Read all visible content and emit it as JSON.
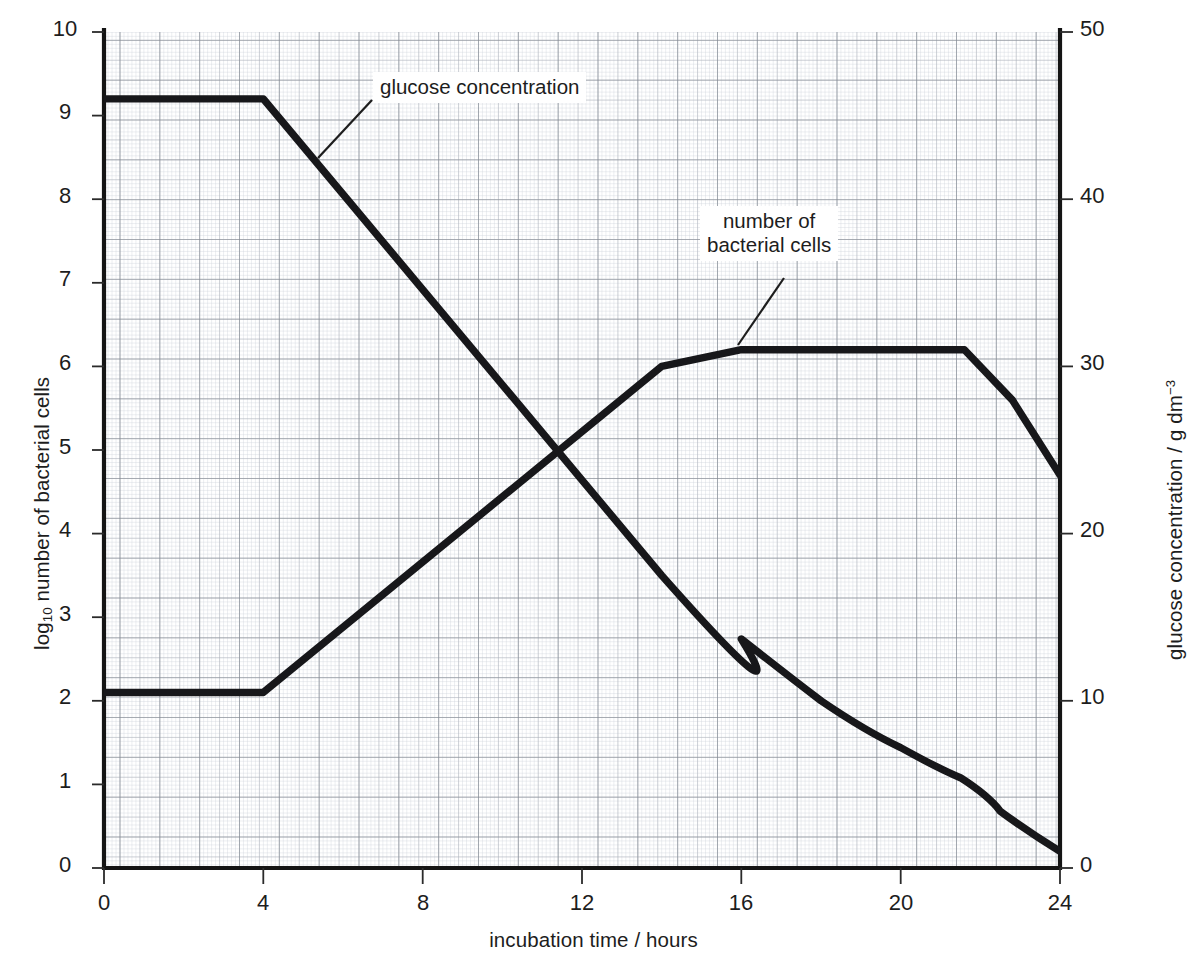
{
  "chart_data": {
    "type": "line",
    "title": "",
    "xlabel": "incubation time / hours",
    "ylabel_left": "log10 number of bacterial cells",
    "ylabel_right": "glucose concentration / g dm-3",
    "xlim": [
      0,
      24
    ],
    "xticks": [
      0,
      4,
      8,
      12,
      16,
      20,
      24
    ],
    "ylim_left": [
      0,
      10
    ],
    "yticks_left": [
      0,
      1,
      2,
      3,
      4,
      5,
      6,
      7,
      8,
      9,
      10
    ],
    "ylim_right": [
      0,
      50
    ],
    "yticks_right": [
      0,
      10,
      20,
      30,
      40,
      50
    ],
    "grid": true,
    "grid_minor_step_x": 0.1,
    "grid_minor_step_y": 0.1,
    "legend": "annotations",
    "series": [
      {
        "name": "number of bacterial cells",
        "axis": "left",
        "units": "log10 cells",
        "x": [
          0,
          4,
          14,
          16,
          21.6,
          22.8,
          24
        ],
        "values": [
          2.1,
          2.1,
          6.0,
          6.2,
          6.2,
          5.6,
          4.7
        ]
      },
      {
        "name": "glucose concentration",
        "axis": "right",
        "units": "g dm-3",
        "x": [
          0,
          4,
          14,
          16,
          18,
          20,
          21.5,
          22.5,
          24
        ],
        "values": [
          46.0,
          46.0,
          17.5,
          13.7,
          10.0,
          7.2,
          5.4,
          3.4,
          1.0
        ]
      }
    ],
    "annotations": [
      {
        "name": "glucose-concentration-label",
        "lines": [
          "glucose concentration"
        ],
        "box_x": 373,
        "box_y": 72,
        "leader_from_x": 372,
        "leader_from_y": 100,
        "leader_to_x": 318,
        "leader_to_y": 158
      },
      {
        "name": "number-of-bacterial-cells-label",
        "lines": [
          "number of bacterial",
          "cells"
        ],
        "box_x": 700,
        "box_y": 206,
        "leader_from_x": 784,
        "leader_from_y": 278,
        "leader_to_x": 738,
        "leader_to_y": 345
      }
    ]
  },
  "axes": {
    "x_title": "incubation time / hours",
    "y_left_title_prefix": "log",
    "y_left_title_sub": "10",
    "y_left_title_rest": " number of bacterial cells",
    "y_right_title_main": "glucose concentration / g dm",
    "y_right_title_sup": "−3",
    "x_tick_labels": [
      "0",
      "4",
      "8",
      "12",
      "16",
      "20",
      "24"
    ],
    "y_left_tick_labels": [
      "10",
      "9",
      "8",
      "7",
      "6",
      "5",
      "4",
      "3",
      "2",
      "1",
      "0"
    ],
    "y_right_tick_labels": [
      "50",
      "40",
      "30",
      "20",
      "10",
      "0"
    ]
  },
  "annotation_text": {
    "glucose_line1": "glucose concentration",
    "bacteria_line1": "number of",
    "bacteria_line2": "bacterial cells"
  },
  "colors": {
    "ink": "#1d1d1d",
    "curve": "#17171a",
    "grid_minor": "#c8ccd2",
    "grid_mid": "#aab0b8",
    "grid_major": "#7d838c",
    "axis": "#111111",
    "background": "#ffffff"
  }
}
